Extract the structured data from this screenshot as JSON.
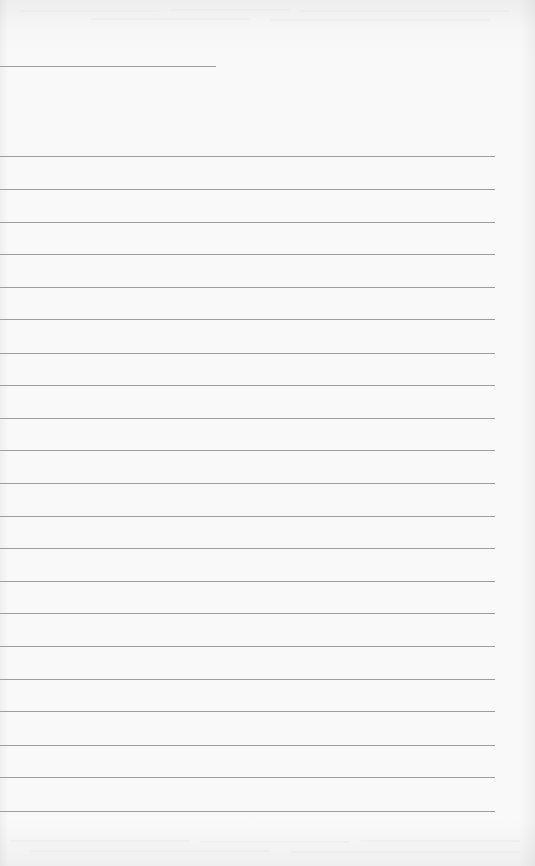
{
  "page": {
    "type": "ruled-sheet",
    "width": 535,
    "height": 866,
    "background_color": "#fdfdfd",
    "line_color": "#9e9e9e"
  },
  "header_line": {
    "y": 66,
    "x_start": 0,
    "x_end": 216,
    "text": ""
  },
  "rules": {
    "count": 21,
    "x_start": 0,
    "x_end": 495,
    "positions_y": [
      156,
      189,
      222,
      254,
      287,
      319,
      353,
      385,
      418,
      450,
      483,
      516,
      548,
      581,
      613,
      646,
      679,
      711,
      745,
      777,
      811
    ],
    "lines_text": [
      "",
      "",
      "",
      "",
      "",
      "",
      "",
      "",
      "",
      "",
      "",
      "",
      "",
      "",
      "",
      "",
      "",
      "",
      "",
      "",
      ""
    ]
  }
}
